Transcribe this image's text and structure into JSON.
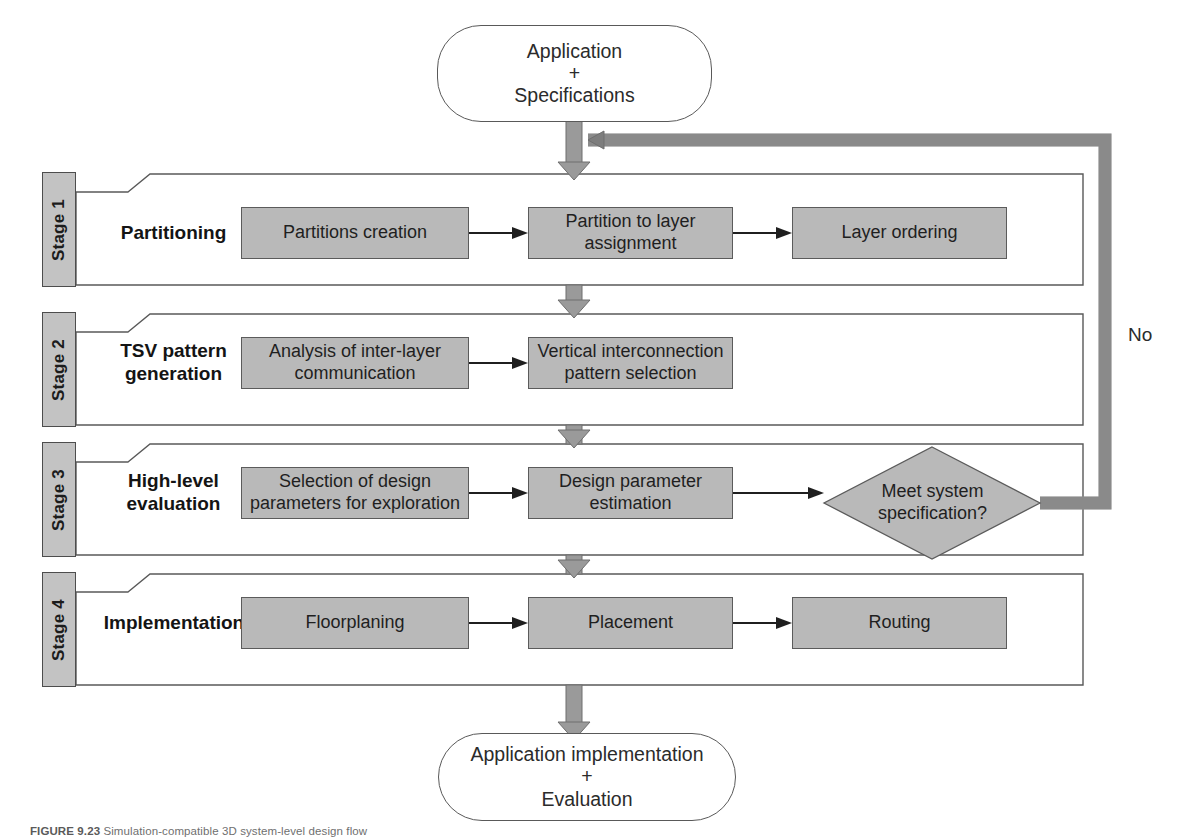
{
  "figure": {
    "caption_prefix": "FIGURE",
    "caption_number": "9.23",
    "caption_text": "Simulation-compatible 3D system-level design flow"
  },
  "start_node": {
    "line1": "Application",
    "plus": "+",
    "line2": "Specifications"
  },
  "end_node": {
    "line1": "Application implementation",
    "plus": "+",
    "line2": "Evaluation"
  },
  "feedback": {
    "label": "No"
  },
  "decision": {
    "line1": "Meet system",
    "line2": "specification?"
  },
  "stages": [
    {
      "tab": "Stage 1",
      "title_line1": "Partitioning",
      "title_line2": "",
      "steps": [
        {
          "line1": "Partitions creation",
          "line2": ""
        },
        {
          "line1": "Partition to layer",
          "line2": "assignment"
        },
        {
          "line1": "Layer ordering",
          "line2": ""
        }
      ]
    },
    {
      "tab": "Stage 2",
      "title_line1": "TSV pattern",
      "title_line2": "generation",
      "steps": [
        {
          "line1": "Analysis of inter-layer",
          "line2": "communication"
        },
        {
          "line1": "Vertical interconnection",
          "line2": "pattern selection"
        }
      ]
    },
    {
      "tab": "Stage 3",
      "title_line1": "High-level",
      "title_line2": "evaluation",
      "steps": [
        {
          "line1": "Selection of design",
          "line2": "parameters for exploration"
        },
        {
          "line1": "Design parameter",
          "line2": "estimation"
        }
      ]
    },
    {
      "tab": "Stage 4",
      "title_line1": "Implementation",
      "title_line2": "",
      "steps": [
        {
          "line1": "Floorplaning",
          "line2": ""
        },
        {
          "line1": "Placement",
          "line2": ""
        },
        {
          "line1": "Routing",
          "line2": ""
        }
      ]
    }
  ],
  "colors": {
    "box_fill": "#b9b9b9",
    "box_stroke": "#5b5b5b",
    "tab_fill": "#c3c3c3",
    "connector_fill": "#9a9a9a",
    "connector_stroke": "#6e6e6e",
    "outline": "#595959"
  }
}
